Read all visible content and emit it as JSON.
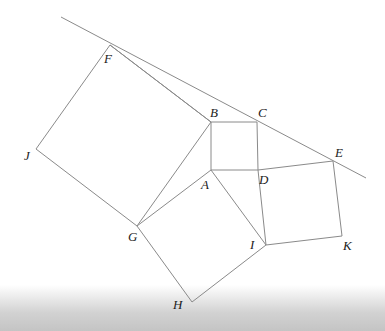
{
  "diagram": {
    "type": "geometry",
    "colors": {
      "line": "#8a8a8a",
      "label": "#222222",
      "background": "#ffffff"
    },
    "points": {
      "A": {
        "label": "A",
        "x": 211,
        "y": 170
      },
      "B": {
        "label": "B",
        "x": 211,
        "y": 122
      },
      "C": {
        "label": "C",
        "x": 257,
        "y": 122
      },
      "D": {
        "label": "D",
        "x": 258,
        "y": 170
      },
      "E": {
        "label": "E",
        "x": 333,
        "y": 161
      },
      "F": {
        "label": "F",
        "x": 110,
        "y": 45
      },
      "G": {
        "label": "G",
        "x": 137,
        "y": 226
      },
      "H": {
        "label": "H",
        "x": 192,
        "y": 302
      },
      "I": {
        "label": "I",
        "x": 266,
        "y": 245
      },
      "J": {
        "label": "J",
        "x": 36,
        "y": 149
      },
      "K": {
        "label": "K",
        "x": 342,
        "y": 236
      }
    },
    "labels": {
      "A": "A",
      "B": "B",
      "C": "C",
      "D": "D",
      "E": "E",
      "F": "F",
      "G": "G",
      "H": "H",
      "I": "I",
      "J": "J",
      "K": "K"
    }
  }
}
